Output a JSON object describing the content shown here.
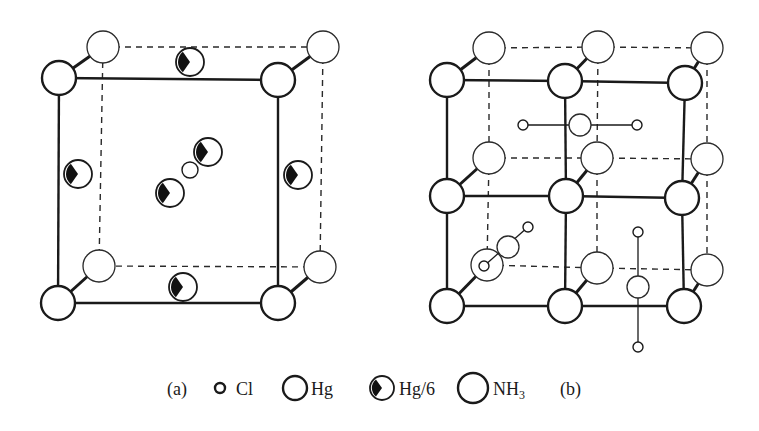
{
  "legend": {
    "label_a": "(a)",
    "label_b": "(b)",
    "items": [
      {
        "symbol": "Cl",
        "label": "Cl",
        "cx": 220,
        "cy": 388,
        "r": 5,
        "kind": "cl",
        "text_x": 236
      },
      {
        "symbol": "Hg",
        "label": "Hg",
        "cx": 295,
        "cy": 388,
        "r": 12,
        "kind": "front",
        "text_x": 311
      },
      {
        "symbol": "Hg/6",
        "label": "Hg/6",
        "cx": 382,
        "cy": 388,
        "r": 12,
        "kind": "hg6",
        "text_x": 399
      },
      {
        "symbol": "NH3",
        "label": "NH",
        "sub": "3",
        "cx": 473,
        "cy": 388,
        "r": 15,
        "kind": "back",
        "text_x": 493
      }
    ],
    "label_a_x": 167,
    "label_b_x": 560,
    "baseline_y": 395
  },
  "diagram_a": {
    "caption": "(a)",
    "front_square": [
      [
        59,
        78
      ],
      [
        278,
        80
      ],
      [
        278,
        303
      ],
      [
        58,
        303
      ]
    ],
    "back_square": [
      [
        103,
        47
      ],
      [
        323,
        47
      ],
      [
        320,
        267
      ],
      [
        99,
        266
      ]
    ],
    "front_hg": [
      [
        59,
        78
      ],
      [
        278,
        80
      ],
      [
        278,
        303
      ],
      [
        58,
        303
      ]
    ],
    "back_nh3": [
      [
        103,
        47
      ],
      [
        323,
        47
      ],
      [
        320,
        267
      ],
      [
        99,
        266
      ]
    ],
    "hg6": [
      [
        190,
        62
      ],
      [
        78,
        174
      ],
      [
        298,
        175
      ],
      [
        183,
        287
      ],
      [
        208,
        152
      ],
      [
        170,
        193
      ]
    ],
    "cl": [
      [
        190,
        170
      ]
    ],
    "radii": {
      "front": 17,
      "back": 16,
      "hg6": 14,
      "cl": 8
    }
  },
  "diagram_b": {
    "caption": "(b)",
    "front_grid": [
      [
        [
          447,
          80
        ],
        [
          565,
          81
        ],
        [
          685,
          83
        ]
      ],
      [
        [
          447,
          196
        ],
        [
          566,
          196
        ],
        [
          682,
          198
        ]
      ],
      [
        [
          447,
          306
        ],
        [
          565,
          306
        ],
        [
          684,
          306
        ]
      ]
    ],
    "back_grid": [
      [
        [
          489,
          48
        ],
        [
          598,
          47
        ],
        [
          707,
          48
        ]
      ],
      [
        [
          489,
          158
        ],
        [
          597,
          158
        ],
        [
          707,
          159
        ]
      ],
      [
        [
          487,
          265
        ],
        [
          597,
          268
        ],
        [
          707,
          270
        ]
      ]
    ],
    "molecules": [
      {
        "orientation": "horizontal",
        "cl1": [
          523,
          125
        ],
        "hg": [
          580,
          125
        ],
        "cl2": [
          637,
          125
        ]
      },
      {
        "orientation": "diagonal",
        "cl1": [
          528,
          227
        ],
        "hg": [
          508,
          247
        ],
        "cl2": [
          484,
          266
        ]
      },
      {
        "orientation": "vertical",
        "cl1": [
          638,
          232
        ],
        "hg": [
          638,
          287
        ],
        "cl2": [
          638,
          347
        ]
      }
    ],
    "radii": {
      "front": 17,
      "back": 16,
      "mol_hg": 11,
      "mol_cl": 5
    }
  }
}
